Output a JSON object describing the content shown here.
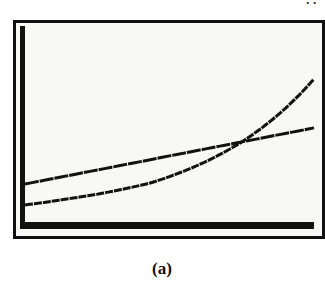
{
  "figure": {
    "caption": "(a)",
    "top_fragment": " ··"
  },
  "colors": {
    "ink": "#111111",
    "screen_bg": "#f8f8f6"
  },
  "chart_data": {
    "type": "line",
    "title": "",
    "xlabel": "",
    "ylabel": "",
    "xlim": [
      0,
      10
    ],
    "ylim": [
      0,
      10
    ],
    "grid": false,
    "legend": "none",
    "axes": "left and bottom axes drawn as thick bars; no tick labels",
    "series": [
      {
        "name": "linear",
        "x": [
          0,
          10
        ],
        "y": [
          1.94,
          4.8
        ]
      },
      {
        "name": "exponential",
        "x": [
          0,
          1.21,
          4.33,
          7.44,
          10
        ],
        "y": [
          0.87,
          1.12,
          1.99,
          4.03,
          7.3
        ]
      }
    ],
    "annotations": [
      "Curves intersect near x≈7.5, y≈4.1"
    ]
  }
}
